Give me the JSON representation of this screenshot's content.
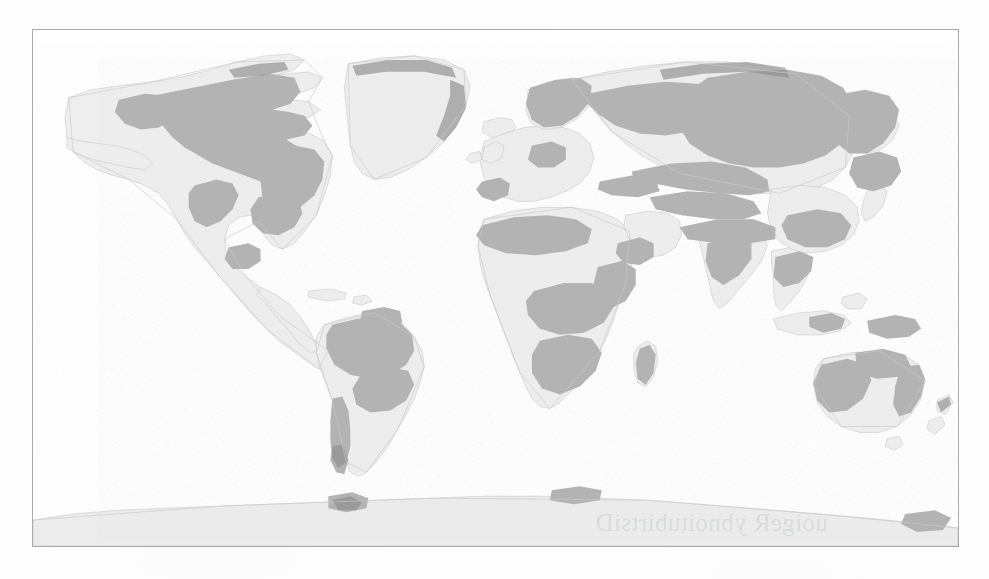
{
  "figure": {
    "kind": "world-map",
    "projection": "equirectangular",
    "caption_bleed_through": "uoigeR ybnoitubirtsiD",
    "frame": {
      "x": 32,
      "y": 29,
      "width": 927,
      "height": 518,
      "border_color": "#a9a9ad",
      "border_width_px": 1
    }
  },
  "palette": {
    "page_background": "#ffffff",
    "map_background": "#ffffff",
    "ocean": "#ffffff",
    "land_base": "#eeeeee",
    "land_base_alt": "#ebebeb",
    "highlight_fill": "#b3b3b3",
    "highlight_dark": "#9a9a9a",
    "coastline_stroke": "#c9c9c9",
    "coastline_dark": "#6e6e6e",
    "antarctica_fill": "#ececec",
    "frame_border": "#a9a9ad"
  },
  "legend": {
    "present": false,
    "classes": [
      {
        "name": "land-unshaded",
        "label": "Land (base)",
        "color": "#eeeeee"
      },
      {
        "name": "land-shaded",
        "label": "Highlighted region",
        "color": "#b3b3b3"
      },
      {
        "name": "ocean",
        "label": "Ocean / water",
        "color": "#ffffff"
      }
    ]
  },
  "chart_data": {
    "type": "map",
    "title": "",
    "xlabel": "",
    "ylabel": "",
    "projection": "equirectangular",
    "lon_range": [
      -180,
      180
    ],
    "lat_range": [
      -90,
      90
    ],
    "grid": false,
    "regions_visible": [
      "North America",
      "Greenland",
      "Iceland",
      "South America",
      "Europe",
      "Scandinavia",
      "Africa",
      "Madagascar",
      "Middle East",
      "Russia / Siberia",
      "Central Asia",
      "South Asia",
      "Southeast Asia",
      "Japan",
      "Indonesia",
      "Australia",
      "New Zealand",
      "Antarctica"
    ],
    "shading_classes": [
      "land-unshaded",
      "land-shaded"
    ]
  }
}
